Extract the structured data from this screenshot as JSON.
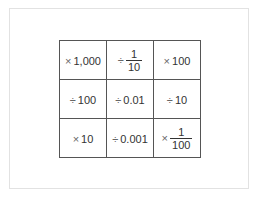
{
  "grid": {
    "rows": [
      [
        {
          "op": "×",
          "value": "1,000",
          "type": "number"
        },
        {
          "op": "÷",
          "numerator": "1",
          "denominator": "10",
          "type": "fraction"
        },
        {
          "op": "×",
          "value": "100",
          "type": "number"
        }
      ],
      [
        {
          "op": "÷",
          "value": "100",
          "type": "number"
        },
        {
          "op": "÷",
          "value": "0.01",
          "type": "number"
        },
        {
          "op": "÷",
          "value": "10",
          "type": "number"
        }
      ],
      [
        {
          "op": "×",
          "value": "10",
          "type": "number"
        },
        {
          "op": "÷",
          "value": "0.001",
          "type": "number"
        },
        {
          "op": "×",
          "numerator": "1",
          "denominator": "100",
          "type": "fraction"
        }
      ]
    ]
  }
}
